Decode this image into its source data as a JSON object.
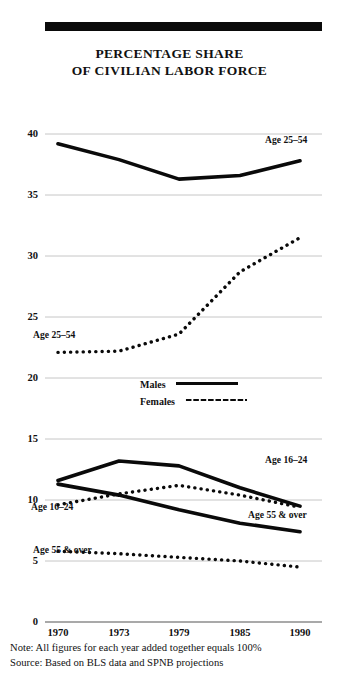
{
  "title": {
    "line1": "PERCENTAGE SHARE",
    "line2": "OF CIVILIAN LABOR FORCE"
  },
  "legend": {
    "males_label": "Males",
    "females_label": "Females"
  },
  "footnotes": {
    "note": "Note: All figures for each year added together equals 100%",
    "source": "Source: Based on BLS data and SPNB projections"
  },
  "annotations": {
    "males_25_54": "Age 25–54",
    "females_25_54": "Age 25–54",
    "males_16_24": "Age 16–24",
    "females_16_24": "Age 16–24",
    "males_55_over": "Age 55 & over",
    "females_55_over": "Age 55 & over"
  },
  "axis": {
    "y_ticks": [
      "40",
      "35",
      "30",
      "25",
      "20",
      "15",
      "10",
      "5",
      "0"
    ],
    "x_ticks": [
      "1970",
      "1973",
      "1979",
      "1985",
      "1990"
    ]
  },
  "colors": {
    "ink": "#0a0a0a",
    "grid": "#b8b8b8",
    "background": "#ffffff"
  },
  "chart_data": {
    "type": "line",
    "title": "PERCENTAGE SHARE OF CIVILIAN LABOR FORCE",
    "xlabel": "",
    "ylabel": "",
    "x": [
      1970,
      1973,
      1979,
      1985,
      1990
    ],
    "ylim": [
      0,
      40
    ],
    "yticks": [
      0,
      5,
      10,
      15,
      20,
      25,
      30,
      35,
      40
    ],
    "grid": true,
    "legend_position": "center",
    "note": "Note: All figures for each year added together equals 100%",
    "source": "Source: Based on BLS data and SPNB projections",
    "series": [
      {
        "name": "Males Age 25–54",
        "style": "solid",
        "label": "Age 25–54",
        "values": [
          39.2,
          37.9,
          36.3,
          36.6,
          37.8
        ]
      },
      {
        "name": "Females Age 25–54",
        "style": "dotted",
        "label": "Age 25–54",
        "values": [
          22.1,
          22.2,
          23.6,
          28.7,
          31.5
        ]
      },
      {
        "name": "Males Age 16–24",
        "style": "solid",
        "label": "Age 16–24",
        "values": [
          11.6,
          13.2,
          12.8,
          11.0,
          9.5
        ]
      },
      {
        "name": "Females Age 16–24",
        "style": "dotted",
        "label": "Age 16–24",
        "values": [
          9.6,
          10.5,
          11.2,
          10.4,
          9.4
        ]
      },
      {
        "name": "Males Age 55 & over",
        "style": "solid",
        "label": "Age 55 & over",
        "values": [
          11.3,
          10.4,
          9.2,
          8.1,
          7.4
        ]
      },
      {
        "name": "Females Age 55 & over",
        "style": "dotted",
        "label": "Age 55 & over",
        "values": [
          5.8,
          5.6,
          5.3,
          5.0,
          4.5
        ]
      }
    ]
  }
}
